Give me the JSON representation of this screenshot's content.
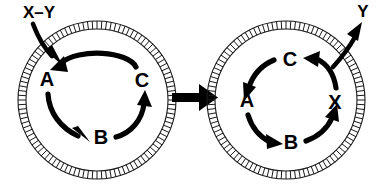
{
  "figure": {
    "background_color": "#ffffff",
    "ink_color": "#000000",
    "membrane_color": "#1a1a1a"
  },
  "left_cell": {
    "name": "left-compartment",
    "membrane": {
      "name": "membrane-ring",
      "style": "hatched-double-ring",
      "center_x": 97,
      "center_y": 100,
      "outer_radius": 79,
      "inner_radius": 71,
      "rung_count": 104
    },
    "cycle": {
      "direction": "counterclockwise",
      "nodes": [
        {
          "id": "A",
          "label": "A",
          "x": 47,
          "y": 80
        },
        {
          "id": "B",
          "label": "B",
          "x": 101,
          "y": 138
        },
        {
          "id": "C",
          "label": "C",
          "x": 142,
          "y": 81
        }
      ],
      "edges": [
        {
          "from": "C",
          "to": "A",
          "label": ""
        },
        {
          "from": "A",
          "to": "B",
          "label": ""
        },
        {
          "from": "B",
          "to": "C",
          "label": ""
        }
      ]
    },
    "input": {
      "name": "substrate-input",
      "label": "X–Y",
      "label_x": 39,
      "label_y": 14,
      "direction": "inward",
      "crosses_membrane": true
    }
  },
  "transition": {
    "name": "transition-arrow",
    "label": "",
    "direction": "right",
    "x": 172,
    "y": 97,
    "length": 44
  },
  "right_cell": {
    "name": "right-compartment",
    "membrane": {
      "name": "membrane-ring",
      "style": "hatched-double-ring",
      "center_x": 286,
      "center_y": 100,
      "outer_radius": 79,
      "inner_radius": 71,
      "rung_count": 104
    },
    "cycle": {
      "direction": "counterclockwise",
      "nodes": [
        {
          "id": "C",
          "label": "C",
          "x": 290,
          "y": 60
        },
        {
          "id": "A",
          "label": "A",
          "x": 247,
          "y": 101
        },
        {
          "id": "B",
          "label": "B",
          "x": 291,
          "y": 143
        },
        {
          "id": "X",
          "label": "X",
          "x": 335,
          "y": 103
        }
      ],
      "edges": [
        {
          "from": "X",
          "to": "C",
          "label": ""
        },
        {
          "from": "C",
          "to": "A",
          "label": ""
        },
        {
          "from": "A",
          "to": "B",
          "label": ""
        },
        {
          "from": "B",
          "to": "X",
          "label": ""
        }
      ]
    },
    "output": {
      "name": "product-output",
      "label": "Y",
      "label_x": 362,
      "label_y": 13,
      "direction": "outward",
      "crosses_membrane": true
    }
  }
}
